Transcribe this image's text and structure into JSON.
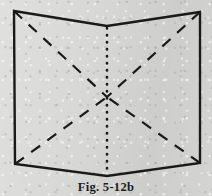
{
  "figure": {
    "caption": "Fig. 5-12b",
    "alt_description": "Geometric line drawing of an open folded sheet (book-like) with dashed diagonals meeting at a center X and a dotted vertical fold line",
    "background_color": "#d8d8d6",
    "ink_color": "#1a1a1a",
    "canvas": {
      "width": 212,
      "height": 196
    },
    "outline": {
      "name": "folded-sheet-outline",
      "style": "solid",
      "stroke_width": 2.4,
      "points": [
        {
          "label": "top-left-corner",
          "x": 14,
          "y": 11
        },
        {
          "label": "top-center-vertex",
          "x": 107,
          "y": 26
        },
        {
          "label": "top-right-corner",
          "x": 200,
          "y": 12
        },
        {
          "label": "bottom-right-corner",
          "x": 200,
          "y": 163
        },
        {
          "label": "bottom-center-vertex",
          "x": 107,
          "y": 176
        },
        {
          "label": "bottom-left-corner",
          "x": 15,
          "y": 164
        }
      ]
    },
    "center_point": {
      "label": "center-crossing",
      "x": 107,
      "y": 97
    },
    "diagonals": {
      "style": "dashed",
      "stroke_width": 2.2,
      "dash_pattern": "11 9",
      "lines": [
        {
          "name": "diagonal-top-left-to-center",
          "x1": 14,
          "y1": 11,
          "x2": 107,
          "y2": 97
        },
        {
          "name": "diagonal-top-right-to-center",
          "x1": 200,
          "y1": 12,
          "x2": 107,
          "y2": 97
        },
        {
          "name": "diagonal-bottom-left-to-center",
          "x1": 15,
          "y1": 164,
          "x2": 107,
          "y2": 97
        },
        {
          "name": "diagonal-bottom-right-to-center",
          "x1": 200,
          "y1": 163,
          "x2": 107,
          "y2": 97
        }
      ]
    },
    "fold_line": {
      "name": "vertical-center-fold",
      "style": "dotted",
      "stroke_width": 2.6,
      "dash_pattern": "0.5 6.5",
      "x1": 107,
      "y1": 28,
      "x2": 107,
      "y2": 174
    }
  }
}
